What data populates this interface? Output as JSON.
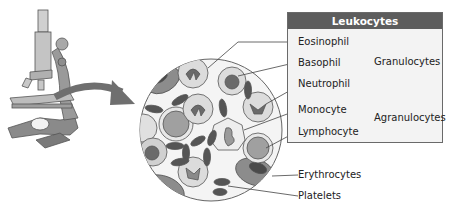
{
  "legend_box": {
    "title": "Leukocytes",
    "cells": [
      {
        "name": "Eosinophil",
        "group": "Granulocytes"
      },
      {
        "name": "Basophil",
        "group": "Granulocytes"
      },
      {
        "name": "Neutrophil",
        "group": "Granulocytes"
      },
      {
        "name": "Monocyte",
        "group": "Agranulocytes"
      },
      {
        "name": "Lymphocyte",
        "group": "Agranulocytes"
      }
    ],
    "groups": [
      "Granulocytes",
      "Agranulocytes"
    ]
  },
  "other_labels": {
    "erythrocytes": "Erythrocytes",
    "platelets": "Platelets"
  },
  "illustration": {
    "instrument": "microscope",
    "view": "magnified blood smear",
    "colors": {
      "header_bg": "#5d5d5d",
      "box_bg": "#f3f3f3",
      "cell_fill": "#d8d8d8",
      "nucleus": "#6b6b6b",
      "rbc": "#8a8a8a",
      "platelet": "#555555"
    }
  }
}
